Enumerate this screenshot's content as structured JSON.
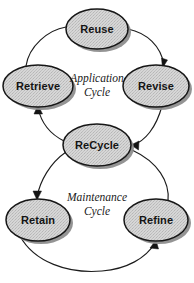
{
  "diagram": {
    "background_color": "#ffffff",
    "node_fill_color": "#d6d6d6",
    "node_stroke_color": "#161616",
    "shadow_color": "#8e8e8e",
    "arc_color": "#1c1c1c",
    "label_color": "#141414",
    "nodes": [
      {
        "id": "reuse",
        "label": "Reuse",
        "cx": 97,
        "cy": 29,
        "rx": 31,
        "ry": 20
      },
      {
        "id": "retrieve",
        "label": "Retrieve",
        "cx": 38,
        "cy": 86,
        "rx": 35,
        "ry": 21
      },
      {
        "id": "revise",
        "label": "Revise",
        "cx": 156,
        "cy": 86,
        "rx": 33,
        "ry": 21
      },
      {
        "id": "recycle",
        "label": "ReCycle",
        "cx": 97,
        "cy": 145,
        "rx": 34,
        "ry": 21
      },
      {
        "id": "retain",
        "label": "Retain",
        "cx": 38,
        "cy": 220,
        "rx": 32,
        "ry": 21
      },
      {
        "id": "refine",
        "label": "Refine",
        "cx": 156,
        "cy": 220,
        "rx": 32,
        "ry": 21
      }
    ],
    "cycle_labels": [
      {
        "id": "application-cycle",
        "line1": "Application",
        "line2": "Cycle",
        "cx": 97,
        "cy": 84
      },
      {
        "id": "maintenance-cycle",
        "line1": "Maintenance",
        "line2": "Cycle",
        "cx": 97,
        "cy": 203
      }
    ],
    "edges": [
      {
        "id": "retrieve-to-reuse",
        "from": "retrieve",
        "to": "reuse",
        "arrow": false
      },
      {
        "id": "reuse-to-revise",
        "from": "reuse",
        "to": "revise",
        "arrow": true
      },
      {
        "id": "revise-to-recycle",
        "from": "revise",
        "to": "recycle",
        "arrow": true
      },
      {
        "id": "recycle-to-retrieve",
        "from": "recycle",
        "to": "retrieve",
        "arrow": true
      },
      {
        "id": "recycle-to-retain",
        "from": "recycle",
        "to": "retain",
        "arrow": true
      },
      {
        "id": "retain-to-refine",
        "from": "retain",
        "to": "refine",
        "arrow": true
      },
      {
        "id": "refine-to-recycle",
        "from": "refine",
        "to": "recycle",
        "arrow": false
      }
    ]
  }
}
